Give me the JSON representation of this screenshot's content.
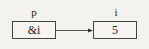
{
  "variables": [
    {
      "name": "p",
      "value": "&i"
    },
    {
      "name": "i",
      "value": "5"
    }
  ],
  "edges": [
    {
      "from": "p",
      "to": "i",
      "kind": "pointer-arrow"
    }
  ],
  "colors": {
    "stroke": "#444444",
    "background": "#f4f2ee"
  }
}
